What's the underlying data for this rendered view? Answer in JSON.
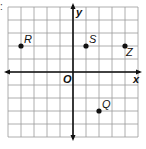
{
  "prefix": ":",
  "graph": {
    "x_axis_label": "x",
    "y_axis_label": "y",
    "origin_label": "O",
    "x_range": [
      -5,
      5
    ],
    "y_range": [
      -5,
      5
    ],
    "grid": true,
    "points": [
      {
        "label": "R",
        "x": -4,
        "y": 2
      },
      {
        "label": "S",
        "x": 1,
        "y": 2
      },
      {
        "label": "Z",
        "x": 4,
        "y": 2
      },
      {
        "label": "Q",
        "x": 2,
        "y": -3
      }
    ]
  }
}
